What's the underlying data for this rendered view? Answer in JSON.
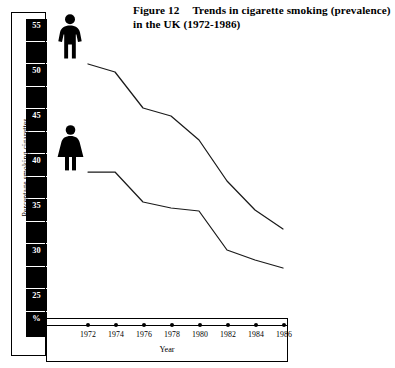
{
  "figure": {
    "number": "Figure 12",
    "title_line1": "Trends in cigarette smoking (prevalence)",
    "title_line2": "in the UK (1972-1986)"
  },
  "axes": {
    "y_label": "Percentage smoking cigarettes",
    "y_unit_label": "%",
    "x_label": "Year"
  },
  "legend": {
    "male_icon": "male-pictogram-icon",
    "female_icon": "female-pictogram-icon"
  },
  "colors": {
    "line": "#1a1a1a",
    "axis_block": "#000000",
    "background": "#ffffff",
    "tick_text": "#ffffff"
  },
  "chart_data": {
    "type": "line",
    "xlabel": "Year",
    "ylabel": "Percentage smoking cigarettes",
    "x": [
      1972,
      1974,
      1976,
      1978,
      1980,
      1982,
      1984,
      1986
    ],
    "xlim": [
      1972,
      1986
    ],
    "ylim": [
      24,
      57
    ],
    "yticks": [
      25,
      30,
      35,
      40,
      45,
      50,
      55
    ],
    "ytick_labels": [
      "25",
      "30",
      "35",
      "40",
      "45",
      "50",
      "55"
    ],
    "xtick_labels": [
      "1972",
      "1974",
      "1976",
      "1978",
      "1980",
      "1982",
      "1984",
      "1986"
    ],
    "grid": false,
    "legend_position": "left-pictograms",
    "series": [
      {
        "name": "Men",
        "icon": "male-pictogram-icon",
        "values": [
          52.0,
          51.2,
          46.0,
          45.0,
          42.0,
          38.0,
          36.0,
          35.0
        ]
      },
      {
        "name": "Women",
        "icon": "female-pictogram-icon",
        "values": [
          41.0,
          41.0,
          38.0,
          37.5,
          37.2,
          33.0,
          32.0,
          31.0
        ]
      }
    ]
  },
  "y_stripes": [
    {
      "label": "55",
      "top": 6,
      "height": 22,
      "labelled": true
    },
    {
      "label": "",
      "top": 29,
      "height": 21,
      "labelled": false
    },
    {
      "label": "50",
      "top": 51,
      "height": 22,
      "labelled": true
    },
    {
      "label": "",
      "top": 74,
      "height": 21,
      "labelled": false
    },
    {
      "label": "45",
      "top": 96,
      "height": 22,
      "labelled": true
    },
    {
      "label": "",
      "top": 119,
      "height": 21,
      "labelled": false
    },
    {
      "label": "40",
      "top": 141,
      "height": 22,
      "labelled": true
    },
    {
      "label": "",
      "top": 164,
      "height": 21,
      "labelled": false
    },
    {
      "label": "35",
      "top": 186,
      "height": 22,
      "labelled": true
    },
    {
      "label": "",
      "top": 209,
      "height": 21,
      "labelled": false
    },
    {
      "label": "30",
      "top": 231,
      "height": 22,
      "labelled": true
    },
    {
      "label": "",
      "top": 254,
      "height": 21,
      "labelled": false
    },
    {
      "label": "25",
      "top": 276,
      "height": 22,
      "labelled": true
    },
    {
      "label": "%",
      "top": 299,
      "height": 25,
      "labelled": true
    }
  ],
  "x_ticks": [
    {
      "label": "1972",
      "x": 41
    },
    {
      "label": "1974",
      "x": 69
    },
    {
      "label": "1976",
      "x": 97
    },
    {
      "label": "1978",
      "x": 125
    },
    {
      "label": "1980",
      "x": 153
    },
    {
      "label": "1982",
      "x": 181
    },
    {
      "label": "1984",
      "x": 209
    },
    {
      "label": "1986",
      "x": 237
    }
  ],
  "line_paths": {
    "male": "M 42,52 L 69,60 L 97,96 L 125,104 L 153,128 L 181,169 L 209,198 L 237,217",
    "female": "M 42,160 L 69,160 L 97,190 L 125,196 L 153,199 L 181,238 L 209,248 L 237,256"
  }
}
